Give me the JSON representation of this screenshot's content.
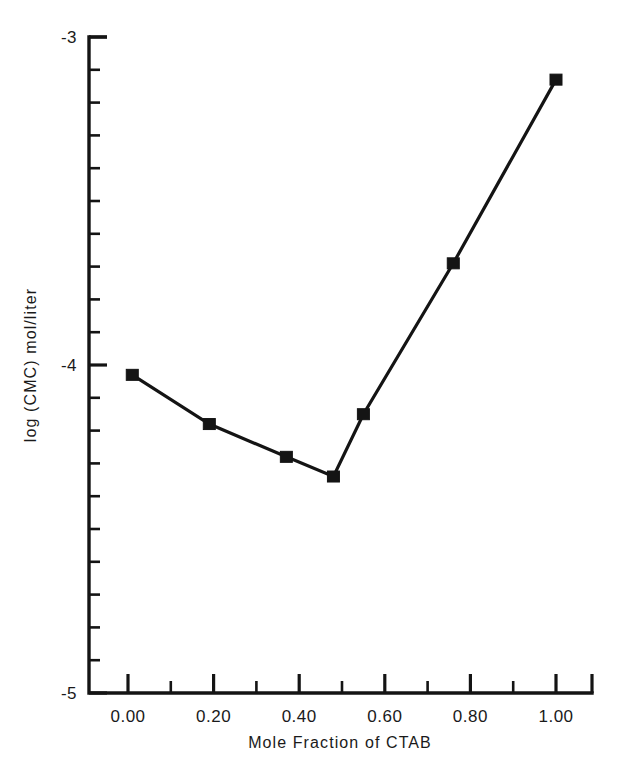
{
  "chart_data": {
    "type": "line",
    "title": "",
    "subtitle": "",
    "xlabel": "Mole Fraction of CTAB",
    "ylabel": "log (CMC)  mol/liter",
    "xlim": [
      -0.04,
      1.09
    ],
    "ylim": [
      -5.0,
      -3.0
    ],
    "grid": false,
    "legend": null,
    "x_major_ticks": [
      0.0,
      0.2,
      0.4,
      0.6,
      0.8,
      1.0
    ],
    "x_tick_labels": [
      "0.00",
      "0.20",
      "0.40",
      "0.60",
      "0.80",
      "1.00"
    ],
    "x_minor_ticks": [
      0.1,
      0.3,
      0.5,
      0.7,
      0.9
    ],
    "y_major_ticks": [
      -3,
      -4,
      -5
    ],
    "y_tick_labels": [
      "-3",
      "-4",
      "-5"
    ],
    "y_minor_tick_count_per_interval": 9,
    "marker": "filled-square",
    "series": [
      {
        "name": "log (CMC)",
        "x": [
          0.01,
          0.19,
          0.37,
          0.48,
          0.55,
          0.76,
          1.0
        ],
        "y": [
          -4.03,
          -4.18,
          -4.28,
          -4.34,
          -4.15,
          -3.69,
          -3.13
        ]
      }
    ]
  },
  "axes": {
    "y_label_text": "log (CMC)  mol/liter",
    "x_label_text": "Mole Fraction of CTAB",
    "y_tick_top": "-3",
    "y_tick_mid": "-4",
    "y_tick_bottom": "-5"
  },
  "colors": {
    "ink": "#141414",
    "background": "#ffffff"
  }
}
